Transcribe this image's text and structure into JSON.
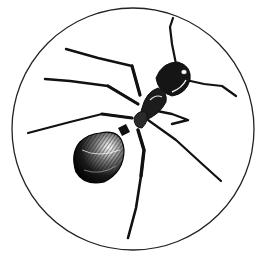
{
  "image": {
    "subject": "Ant illustration (engraving style) inside a circle",
    "colors": {
      "background": "#ffffff",
      "ink": "#111111",
      "circle_stroke": "#222222",
      "highlight": "#e8e8e8"
    }
  }
}
